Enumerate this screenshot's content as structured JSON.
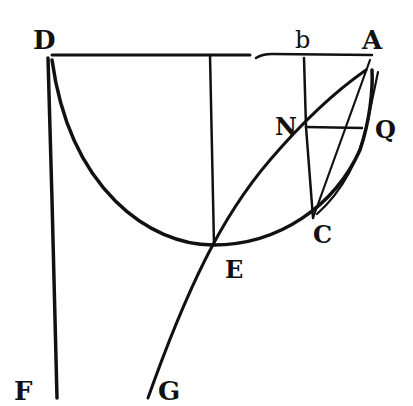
{
  "diagram": {
    "type": "geometric-figure",
    "style": "historical engraving, black ink on white",
    "ink_color": "#111111",
    "background": "#ffffff",
    "points": [
      {
        "id": "D",
        "label": "D",
        "x": 48,
        "y": 55
      },
      {
        "id": "b",
        "label": "b",
        "x": 305,
        "y": 55
      },
      {
        "id": "A",
        "label": "A",
        "x": 372,
        "y": 57
      },
      {
        "id": "N",
        "label": "N",
        "x": 307,
        "y": 127
      },
      {
        "id": "Q",
        "label": "Q",
        "x": 362,
        "y": 127
      },
      {
        "id": "C",
        "label": "C",
        "x": 313,
        "y": 218
      },
      {
        "id": "E",
        "label": "E",
        "x": 213,
        "y": 245
      },
      {
        "id": "F",
        "label": "F",
        "x": 57,
        "y": 398
      },
      {
        "id": "G",
        "label": "G",
        "x": 148,
        "y": 400
      }
    ],
    "labels": {
      "D": "D",
      "b": "b",
      "A": "A",
      "N": "N",
      "Q": "Q",
      "C": "C",
      "E": "E",
      "F": "F",
      "G": "G"
    },
    "elements": [
      {
        "kind": "line",
        "name": "DA",
        "from": "D",
        "to": "A"
      },
      {
        "kind": "line",
        "name": "DF",
        "from": "D",
        "to": "F"
      },
      {
        "kind": "arc",
        "name": "semicircle-DEA",
        "through": [
          "D",
          "E",
          "C",
          "A"
        ]
      },
      {
        "kind": "line",
        "name": "vertical-to-E",
        "from": [
          210,
          55
        ],
        "to": "E"
      },
      {
        "kind": "line",
        "name": "bC",
        "from": "b",
        "to": "C"
      },
      {
        "kind": "line",
        "name": "NQ",
        "from": "N",
        "to": "Q"
      },
      {
        "kind": "line",
        "name": "AC",
        "from": "A",
        "to": "C"
      },
      {
        "kind": "curve",
        "name": "curve-AQ-C",
        "through": [
          "A",
          "Q",
          "C"
        ]
      },
      {
        "kind": "curve",
        "name": "curve-ANEG",
        "through": [
          "A",
          "N",
          "E",
          "G"
        ]
      }
    ]
  }
}
